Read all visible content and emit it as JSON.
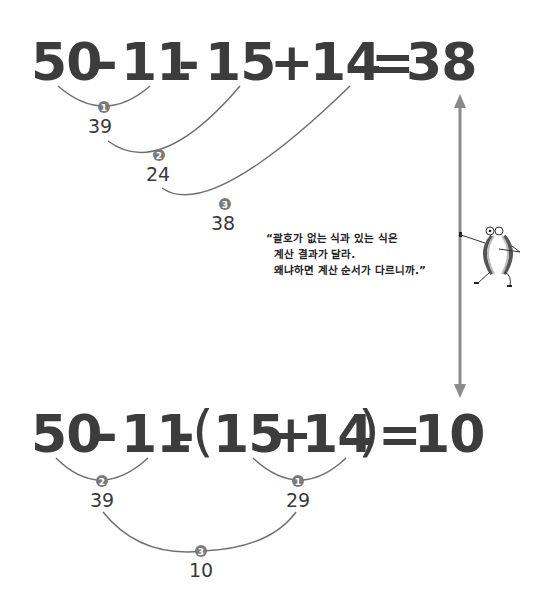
{
  "equation_top": {
    "tokens": [
      "50",
      "-",
      "11",
      "-",
      "15",
      "+",
      "14",
      "=",
      "38"
    ],
    "steps": [
      {
        "step": "1",
        "result": "39"
      },
      {
        "step": "2",
        "result": "24"
      },
      {
        "step": "3",
        "result": "38"
      }
    ]
  },
  "equation_bottom": {
    "tokens": [
      "50",
      "-",
      "11",
      "-",
      "(",
      "15",
      "+",
      "14",
      ")",
      "=",
      "10"
    ],
    "steps": [
      {
        "step": "1",
        "result": "29"
      },
      {
        "step": "2",
        "result": "39"
      },
      {
        "step": "3",
        "result": "10"
      }
    ]
  },
  "quote": {
    "lines": [
      "“괄호가 없는 식과 있는 식은",
      "계산 결과가 달라.",
      "왜냐하면 계산 순서가 다르니까.”"
    ]
  },
  "colors": {
    "text": "#3c3c3c",
    "arc": "#6f6f6f",
    "badge": "#7a7a7a",
    "arrow": "#8a8a8a"
  }
}
